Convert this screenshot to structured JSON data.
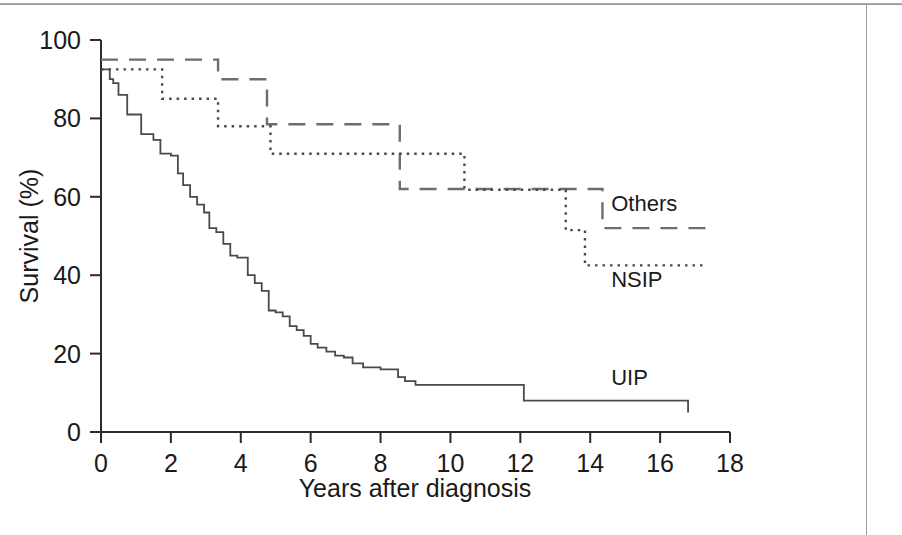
{
  "figure": {
    "background_color": "#ffffff",
    "frame_color": "#9b9b9b",
    "axis_color": "#2b2b2b",
    "label_color": "#1a1a1a"
  },
  "chart_data": {
    "type": "line",
    "title": "",
    "subtitle": "",
    "xlabel": "Years after diagnosis",
    "ylabel": "Survival (%)",
    "xlim": [
      0,
      18
    ],
    "ylim": [
      0,
      100
    ],
    "xticks": [
      0,
      2,
      4,
      6,
      8,
      10,
      12,
      14,
      16,
      18
    ],
    "yticks": [
      0,
      20,
      40,
      60,
      80,
      100
    ],
    "xtick_labels": [
      "0",
      "2",
      "4",
      "6",
      "8",
      "10",
      "12",
      "14",
      "16",
      "18"
    ],
    "ytick_labels": [
      "0",
      "20",
      "40",
      "60",
      "80",
      "100"
    ],
    "grid": false,
    "legend_position": "inline-right-annotations",
    "step_style": "post",
    "series": [
      {
        "name": "Others",
        "line_style": "dashed",
        "color": "#6e6e6e",
        "label_annotation": "Others",
        "label_x": 14.6,
        "label_y": 56.5,
        "x": [
          0.0,
          0.15,
          3.25,
          3.35,
          4.55,
          4.75,
          7.55,
          7.75,
          8.4,
          8.55,
          13.25,
          13.45,
          14.2,
          14.35,
          17.4
        ],
        "y": [
          95,
          95,
          95,
          90,
          90,
          78.5,
          78.5,
          78.5,
          78.5,
          62,
          62,
          62,
          62,
          52,
          52
        ]
      },
      {
        "name": "NSIP",
        "line_style": "dotted",
        "color": "#4a4a4a",
        "label_annotation": "NSIP",
        "label_x": 14.6,
        "label_y": 37.0,
        "x": [
          0.0,
          0.2,
          1.6,
          1.75,
          3.2,
          3.35,
          4.7,
          4.85,
          10.2,
          10.4,
          13.1,
          13.3,
          13.7,
          13.85,
          17.3
        ],
        "y": [
          92.5,
          92.5,
          92.5,
          85,
          85,
          78,
          78,
          71,
          71,
          61.8,
          61.8,
          51.5,
          51.5,
          42.5,
          42.5
        ]
      },
      {
        "name": "UIP",
        "line_style": "solid",
        "color": "#4a4a4a",
        "label_annotation": "UIP",
        "label_x": 14.6,
        "label_y": 12.0,
        "x": [
          0.0,
          0.12,
          0.25,
          0.35,
          0.5,
          0.62,
          0.75,
          0.95,
          1.15,
          1.3,
          1.5,
          1.7,
          1.85,
          2.0,
          2.2,
          2.35,
          2.55,
          2.75,
          2.95,
          3.1,
          3.3,
          3.5,
          3.7,
          3.9,
          4.0,
          4.2,
          4.4,
          4.6,
          4.8,
          5.0,
          5.2,
          5.4,
          5.6,
          5.8,
          6.0,
          6.2,
          6.45,
          6.7,
          6.95,
          7.2,
          7.5,
          8.0,
          8.5,
          8.7,
          9.0,
          10.0,
          11.0,
          11.95,
          12.1,
          14.0,
          16.8
        ],
        "y": [
          92.5,
          92.5,
          90,
          89,
          86,
          86,
          81,
          81,
          76,
          76,
          74.5,
          71,
          71,
          70.5,
          66,
          63,
          60,
          58,
          56,
          52,
          51,
          48,
          45,
          44.5,
          44.5,
          40,
          38,
          36,
          31,
          30.5,
          29.5,
          27,
          26,
          24.5,
          22.5,
          21.5,
          20.5,
          19.5,
          19,
          17.5,
          16.5,
          16,
          14,
          13,
          12,
          12,
          12,
          12,
          8,
          8,
          5
        ]
      }
    ]
  },
  "annotations": {
    "others_label": "Others",
    "nsip_label": "NSIP",
    "uip_label": "UIP"
  },
  "axis": {
    "x_title": "Years after diagnosis",
    "y_title": "Survival (%)"
  }
}
